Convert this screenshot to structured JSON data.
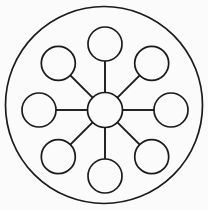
{
  "diagram": {
    "type": "node-link-radial",
    "canvas": {
      "width": 208,
      "height": 210,
      "background_color": "#fbfbfb"
    },
    "style": {
      "stroke_color": "#1a1a1a",
      "node_fill_color": "#fbfbfb",
      "outer_stroke_width": 1.7,
      "node_stroke_width": 1.7,
      "spoke_stroke_width": 1.9
    },
    "outer_boundary": {
      "label": "outer-boundary-circle",
      "cx": 104,
      "cy": 105,
      "r": 98.5
    },
    "hub": {
      "label": "hub-node",
      "cx": 105,
      "cy": 110,
      "r": 17.5
    },
    "satellite_radius": 17,
    "orbit_radius": 66,
    "satellites": [
      {
        "label": "node-top",
        "angle_deg": 270,
        "cx": 105.0,
        "cy": 44.0
      },
      {
        "label": "node-upper-right",
        "angle_deg": 315,
        "cx": 151.7,
        "cy": 63.3
      },
      {
        "label": "node-right",
        "angle_deg": 0,
        "cx": 171.0,
        "cy": 110.0
      },
      {
        "label": "node-lower-right",
        "angle_deg": 45,
        "cx": 151.7,
        "cy": 156.7
      },
      {
        "label": "node-bottom",
        "angle_deg": 90,
        "cx": 105.0,
        "cy": 176.0
      },
      {
        "label": "node-lower-left",
        "angle_deg": 135,
        "cx": 58.3,
        "cy": 156.7
      },
      {
        "label": "node-left",
        "angle_deg": 180,
        "cx": 39.0,
        "cy": 110.0
      },
      {
        "label": "node-upper-left",
        "angle_deg": 225,
        "cx": 58.3,
        "cy": 63.3
      }
    ],
    "spokes": [
      {
        "label": "spoke-top",
        "x1": 105.0,
        "y1": 92.5,
        "x2": 105.0,
        "y2": 61.0
      },
      {
        "label": "spoke-upper-right",
        "x1": 117.4,
        "y1": 97.6,
        "x2": 139.7,
        "y2": 75.3
      },
      {
        "label": "spoke-right",
        "x1": 122.5,
        "y1": 110.0,
        "x2": 154.0,
        "y2": 110.0
      },
      {
        "label": "spoke-lower-right",
        "x1": 117.4,
        "y1": 122.4,
        "x2": 139.7,
        "y2": 144.7
      },
      {
        "label": "spoke-bottom",
        "x1": 105.0,
        "y1": 127.5,
        "x2": 105.0,
        "y2": 159.0
      },
      {
        "label": "spoke-lower-left",
        "x1": 92.6,
        "y1": 122.4,
        "x2": 70.3,
        "y2": 144.7
      },
      {
        "label": "spoke-left",
        "x1": 87.5,
        "y1": 110.0,
        "x2": 56.0,
        "y2": 110.0
      },
      {
        "label": "spoke-upper-left",
        "x1": 92.6,
        "y1": 97.6,
        "x2": 70.3,
        "y2": 75.3
      }
    ],
    "counts": {
      "satellite_count": 8,
      "spoke_count": 8,
      "hub_count": 1
    }
  }
}
